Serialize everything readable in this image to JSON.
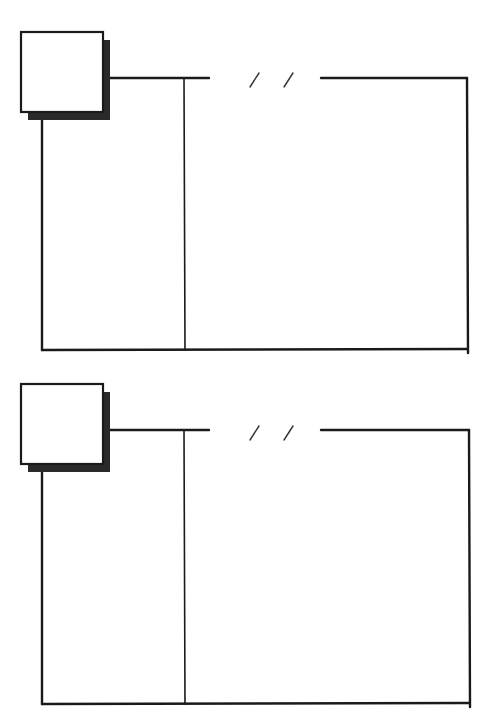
{
  "canvas": {
    "width": 484,
    "height": 712,
    "background": "#ffffff"
  },
  "colors": {
    "ink": "#1a1a1a",
    "shadow": "#2a2a2a",
    "slash": "#333333"
  },
  "panels": [
    {
      "name": "panel-top",
      "offset_y": 0,
      "photo_box": {
        "x": 21,
        "y": 32,
        "w": 82,
        "h": 80,
        "shadow_dx": 7,
        "shadow_dy": 8
      },
      "header_line_left": {
        "x1": 110,
        "x2": 209,
        "y": 78
      },
      "date_slashes": [
        {
          "x1": 250,
          "y1": 87,
          "x2": 259,
          "y2": 73
        },
        {
          "x1": 284,
          "y1": 87,
          "x2": 293,
          "y2": 73
        }
      ],
      "header_line_right": {
        "x1": 321,
        "x2": 467,
        "y": 78
      },
      "frame": {
        "left_x": 42,
        "right_x": 467,
        "top_y": 78,
        "bottom_y": 350
      },
      "column_divider_x": 184
    },
    {
      "name": "panel-bottom",
      "offset_y": 351,
      "photo_box": {
        "x": 21,
        "y": 384,
        "w": 82,
        "h": 80,
        "shadow_dx": 7,
        "shadow_dy": 8
      },
      "header_line_left": {
        "x1": 110,
        "x2": 209,
        "y": 430
      },
      "date_slashes": [
        {
          "x1": 250,
          "y1": 440,
          "x2": 259,
          "y2": 426
        },
        {
          "x1": 284,
          "y1": 440,
          "x2": 293,
          "y2": 426
        }
      ],
      "header_line_right": {
        "x1": 321,
        "x2": 469,
        "y": 430
      },
      "frame": {
        "left_x": 42,
        "right_x": 469,
        "top_y": 430,
        "bottom_y": 704
      },
      "column_divider_x": 184
    }
  ]
}
